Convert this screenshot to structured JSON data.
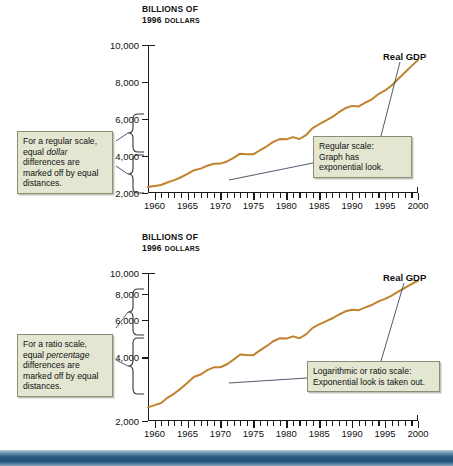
{
  "figure": {
    "footer_band_color": "#2c5b80",
    "curve_color": "#c0822c",
    "callout_fill": "#e3e7d2"
  },
  "charts": [
    {
      "id": "regular-scale",
      "axis_title_line1": "BILLIONS OF",
      "axis_title_line2_number": "1996",
      "axis_title_line2_word": "DOLLARS",
      "series_label": "Real GDP",
      "callout_left": {
        "part1": "For a regular scale, equal ",
        "emphasis": "dollar",
        "part2": " differences are marked off by equal distances."
      },
      "callout_right_line1": "Regular scale:",
      "callout_right_line2": "Graph has",
      "callout_right_line3": "exponential look."
    },
    {
      "id": "ratio-scale",
      "axis_title_line1": "BILLIONS OF",
      "axis_title_line2_number": "1996",
      "axis_title_line2_word": "DOLLARS",
      "series_label": "Real GDP",
      "callout_left": {
        "part1": "For a ratio scale, equal ",
        "emphasis": "percentage",
        "part2": " differences are marked off by equal distances."
      },
      "callout_right_line1": "Logarithmic or ratio scale:",
      "callout_right_line2": "Exponential look is taken out."
    }
  ],
  "chart_data": [
    {
      "type": "line",
      "title": "Real GDP on a regular (linear) scale",
      "xlabel": "",
      "ylabel": "Billions of 1996 dollars",
      "scale": "linear",
      "xlim": [
        1959,
        2000
      ],
      "ylim": [
        2000,
        10000
      ],
      "yticks": [
        2000,
        4000,
        6000,
        8000,
        10000
      ],
      "ytick_labels": [
        "2,000",
        "4,000",
        "6,000",
        "8,000",
        "10,000"
      ],
      "xticks": [
        1960,
        1965,
        1970,
        1975,
        1980,
        1985,
        1990,
        1995,
        2000
      ],
      "xtick_labels": [
        "1960",
        "1965",
        "1970",
        "1975",
        "1980",
        "1985",
        "1990",
        "1995",
        "2000"
      ],
      "minor_xticks_every": 1,
      "grid": false,
      "legend": false,
      "annotations": [
        "For a regular scale, equal dollar differences are marked off by equal distances.",
        "Regular scale: Graph has exponential look."
      ],
      "series": [
        {
          "name": "Real GDP",
          "color": "#c0822c",
          "x": [
            1959,
            1960,
            1961,
            1962,
            1963,
            1964,
            1965,
            1966,
            1967,
            1968,
            1969,
            1970,
            1971,
            1972,
            1973,
            1974,
            1975,
            1976,
            1977,
            1978,
            1979,
            1980,
            1981,
            1982,
            1983,
            1984,
            1985,
            1986,
            1987,
            1988,
            1989,
            1990,
            1991,
            1992,
            1993,
            1994,
            1995,
            1996,
            1997,
            1998,
            1999,
            2000
          ],
          "values": [
            2320,
            2377,
            2433,
            2581,
            2695,
            2851,
            3035,
            3234,
            3316,
            3475,
            3585,
            3589,
            3706,
            3900,
            4124,
            4100,
            4093,
            4312,
            4511,
            4761,
            4913,
            4900,
            5021,
            4919,
            5132,
            5505,
            5717,
            5912,
            6113,
            6368,
            6592,
            6708,
            6676,
            6880,
            7063,
            7348,
            7544,
            7813,
            8160,
            8509,
            8859,
            9191
          ]
        }
      ]
    },
    {
      "type": "line",
      "title": "Real GDP on a ratio (logarithmic) scale",
      "xlabel": "",
      "ylabel": "Billions of 1996 dollars",
      "scale": "log",
      "xlim": [
        1959,
        2000
      ],
      "ylim": [
        2000,
        10000
      ],
      "yticks": [
        2000,
        4000,
        6000,
        8000,
        10000
      ],
      "ytick_labels": [
        "2,000",
        "4,000",
        "6,000",
        "8,000",
        "10,000"
      ],
      "xticks": [
        1960,
        1965,
        1970,
        1975,
        1980,
        1985,
        1990,
        1995,
        2000
      ],
      "xtick_labels": [
        "1960",
        "1965",
        "1970",
        "1975",
        "1980",
        "1985",
        "1990",
        "1995",
        "2000"
      ],
      "minor_xticks_every": 1,
      "grid": false,
      "legend": false,
      "annotations": [
        "For a ratio scale, equal percentage differences are marked off by equal distances.",
        "Logarithmic or ratio scale: Exponential look is taken out."
      ],
      "series": [
        {
          "name": "Real GDP",
          "color": "#c0822c",
          "x": [
            1959,
            1960,
            1961,
            1962,
            1963,
            1964,
            1965,
            1966,
            1967,
            1968,
            1969,
            1970,
            1971,
            1972,
            1973,
            1974,
            1975,
            1976,
            1977,
            1978,
            1979,
            1980,
            1981,
            1982,
            1983,
            1984,
            1985,
            1986,
            1987,
            1988,
            1989,
            1990,
            1991,
            1992,
            1993,
            1994,
            1995,
            1996,
            1997,
            1998,
            1999,
            2000
          ],
          "values": [
            2320,
            2377,
            2433,
            2581,
            2695,
            2851,
            3035,
            3234,
            3316,
            3475,
            3585,
            3589,
            3706,
            3900,
            4124,
            4100,
            4093,
            4312,
            4511,
            4761,
            4913,
            4900,
            5021,
            4919,
            5132,
            5505,
            5717,
            5912,
            6113,
            6368,
            6592,
            6708,
            6676,
            6880,
            7063,
            7348,
            7544,
            7813,
            8160,
            8509,
            8859,
            9191
          ]
        }
      ]
    }
  ]
}
